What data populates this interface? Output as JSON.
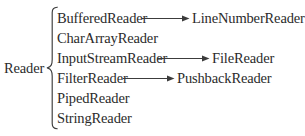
{
  "diagram": {
    "type": "class-hierarchy",
    "background_color": "#ffffff",
    "text_color": "#2b2b2b",
    "line_color": "#3c3c3c",
    "root": {
      "label": "Reader"
    },
    "brace": {
      "glyph": "{",
      "orientation": "right-opening"
    },
    "subclasses": [
      {
        "label": "BufferedReader"
      },
      {
        "label": "CharArrayReader"
      },
      {
        "label": "InputStreamReader"
      },
      {
        "label": "FilterReader"
      },
      {
        "label": "PipedReader"
      },
      {
        "label": "StringReader"
      }
    ],
    "leaf_nodes": [
      {
        "label": "LineNumberReader"
      },
      {
        "label": "FileReader"
      },
      {
        "label": "PushbackReader"
      }
    ],
    "edges": [
      {
        "from": "BufferedReader",
        "to": "LineNumberReader",
        "style": "solid-arrow"
      },
      {
        "from": "InputStreamReader",
        "to": "FileReader",
        "style": "solid-arrow"
      },
      {
        "from": "FilterReader",
        "to": "PushbackReader",
        "style": "solid-arrow"
      }
    ]
  }
}
